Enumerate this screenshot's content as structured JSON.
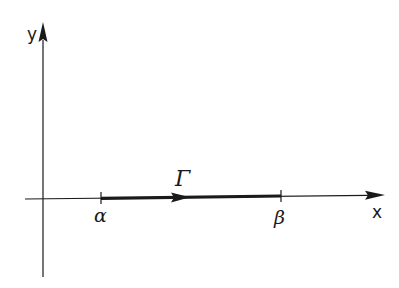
{
  "diagram": {
    "title": "",
    "axes": {
      "x": {
        "label": "x",
        "start": [
          25,
          199
        ],
        "end": [
          385,
          195
        ]
      },
      "y": {
        "label": "y",
        "start": [
          43,
          277
        ],
        "end": [
          43,
          22
        ]
      },
      "origin": [
        43,
        199
      ]
    },
    "path": {
      "label": "Γ",
      "from_label": "α",
      "to_label": "β",
      "from": [
        101,
        198
      ],
      "to": [
        281,
        195
      ],
      "direction": "left-to-right",
      "color": "#1a1a1a"
    },
    "colors": {
      "ink": "#1a1a1a",
      "background": "#ffffff"
    }
  }
}
